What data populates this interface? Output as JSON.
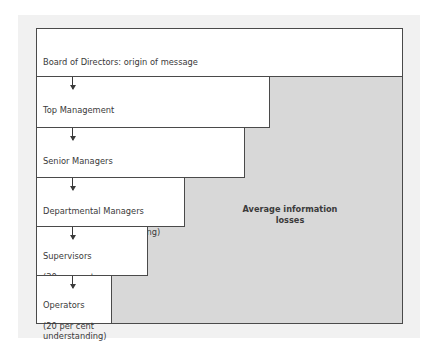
{
  "diagram": {
    "loss_label": "Average information\nlosses",
    "levels": [
      {
        "name": "Board of Directors: origin of message",
        "understanding": "(100 per cent understanding)",
        "percent": 100
      },
      {
        "name": "Top Management",
        "understanding": "(63 per cent understanding)",
        "percent": 63
      },
      {
        "name": "Senior Managers",
        "understanding": "(56 per cent understanding)",
        "percent": 56
      },
      {
        "name": "Departmental Managers",
        "understanding": "(40 per cent understanding)",
        "percent": 40
      },
      {
        "name": "Supervisors",
        "understanding": "(30 per cent\nunderstanding)",
        "percent": 30
      },
      {
        "name": "Operators",
        "understanding": "(20 per cent\nunderstanding)",
        "percent": 20
      }
    ],
    "colors": {
      "panel_bg": "#f1f1f1",
      "loss_area": "#d8d8d8",
      "box_bg": "#ffffff",
      "border": "#4a4a4a",
      "text": "#3a3a3a"
    }
  }
}
